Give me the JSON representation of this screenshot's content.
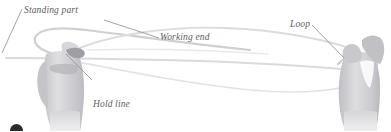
{
  "figure": {
    "type": "knot-tying-instruction-illustration",
    "background_color": "#ffffff",
    "label_color": "#5d5d63",
    "leader_color": "#8b8b90",
    "rope_color": "#d8d8dc",
    "hand_color": "#cfcfd2"
  },
  "labels": {
    "standing_part": "Standing part",
    "working_end": "Working end",
    "loop": "Loop",
    "hold_line_1": "Hold line",
    "hold_line_2": "together"
  },
  "page_mark": {
    "shape": "circle",
    "color": "#2b2b2b"
  }
}
